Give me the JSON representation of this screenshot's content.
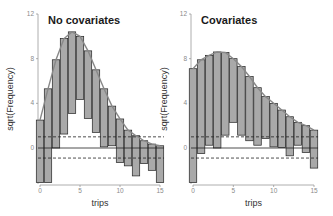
{
  "chart_data": [
    {
      "type": "bar",
      "subtype": "hanging-rootogram",
      "title": "No covariates",
      "xlabel": "trips",
      "ylabel": "sqrt(Frequency)",
      "xlim": [
        0,
        15
      ],
      "ylim": [
        -3.1,
        12
      ],
      "xticks": [
        "0",
        "5",
        "10",
        "15"
      ],
      "yticks": [
        "0",
        "4",
        "8",
        "12"
      ],
      "x": [
        0,
        1,
        2,
        3,
        4,
        5,
        6,
        7,
        8,
        9,
        10,
        11,
        12,
        13,
        14,
        15
      ],
      "bar_top": [
        2.5,
        5.3,
        7.9,
        9.8,
        10.4,
        10.0,
        8.7,
        7.0,
        5.3,
        3.75,
        2.6,
        1.6,
        1.1,
        0.65,
        0.35,
        0.2
      ],
      "bar_bottom": [
        -3.1,
        -3.1,
        0.0,
        1.25,
        3.1,
        4.35,
        2.65,
        1.4,
        0.1,
        0.2,
        -1.3,
        -1.6,
        -2.5,
        -1.4,
        -2.0,
        -3.1
      ],
      "reference_lines": [
        1.0,
        -0.9
      ],
      "grid": false,
      "colors": {
        "bar_fill": "#a9a9a9",
        "bar_stroke": "#222222",
        "curve": "#888888",
        "reference": "#222222"
      }
    },
    {
      "type": "bar",
      "subtype": "hanging-rootogram",
      "title": "Covariates",
      "xlabel": "trips",
      "ylabel": "sqrt(Frequency)",
      "xlim": [
        0,
        15
      ],
      "ylim": [
        -3.1,
        12
      ],
      "xticks": [
        "0",
        "5",
        "10",
        "15"
      ],
      "yticks": [
        "0",
        "4",
        "8",
        "12"
      ],
      "x": [
        0,
        1,
        2,
        3,
        4,
        5,
        6,
        7,
        8,
        9,
        10,
        11,
        12,
        13,
        14,
        15
      ],
      "bar_top": [
        7.1,
        7.9,
        8.3,
        8.6,
        8.55,
        8.0,
        7.3,
        6.4,
        5.4,
        4.6,
        4.0,
        3.4,
        2.8,
        2.3,
        2.0,
        1.6
      ],
      "bar_bottom": [
        -3.1,
        -0.5,
        0.25,
        0.0,
        1.15,
        2.3,
        1.15,
        0.65,
        0.25,
        0.85,
        0.1,
        0.05,
        -0.7,
        0.25,
        -0.4,
        -1.8
      ],
      "reference_lines": [
        1.0,
        -0.9
      ],
      "grid": false,
      "colors": {
        "bar_fill": "#a9a9a9",
        "bar_stroke": "#222222",
        "curve": "#888888",
        "reference": "#222222"
      }
    }
  ]
}
